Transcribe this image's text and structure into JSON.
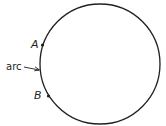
{
  "diagram": {
    "type": "circle-arc",
    "circle": {
      "cx": 100,
      "cy": 64,
      "r": 60,
      "stroke": "#231f20"
    },
    "points": [
      {
        "label": "A",
        "x": 42.5,
        "y": 45
      },
      {
        "label": "B",
        "x": 48.5,
        "y": 96
      }
    ],
    "arc_label": "arc"
  }
}
